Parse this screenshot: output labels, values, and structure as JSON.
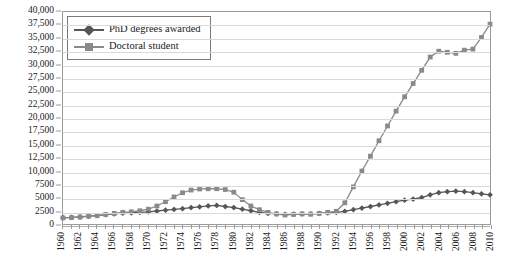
{
  "chart_data": {
    "type": "line",
    "title": "",
    "xlabel": "",
    "ylabel": "",
    "ylim": [
      0,
      40000
    ],
    "ytick_step": 2500,
    "ytick_labels": [
      "40,000",
      "37,500",
      "35,000",
      "32,500",
      "30,000",
      "27,500",
      "25,000",
      "22,500",
      "20,000",
      "17,500",
      "15,000",
      "12,500",
      "10,000",
      "7500",
      "5000",
      "2500",
      "0"
    ],
    "ytick_values": [
      40000,
      37500,
      35000,
      32500,
      30000,
      27500,
      25000,
      22500,
      20000,
      17500,
      15000,
      12500,
      10000,
      7500,
      5000,
      2500,
      0
    ],
    "xlim": [
      1960,
      2010
    ],
    "xtick_labels": [
      "1960",
      "1962",
      "1964",
      "1966",
      "1968",
      "1970",
      "1972",
      "1974",
      "1976",
      "1978",
      "1980",
      "1982",
      "1984",
      "1986",
      "1988",
      "1990",
      "1992",
      "1994",
      "1996",
      "1998",
      "2000",
      "2002",
      "2004",
      "2006",
      "2008",
      "2010"
    ],
    "xtick_label_rotation": 90,
    "x": [
      1960,
      1961,
      1962,
      1963,
      1964,
      1965,
      1966,
      1967,
      1968,
      1969,
      1970,
      1971,
      1972,
      1973,
      1974,
      1975,
      1976,
      1977,
      1978,
      1979,
      1980,
      1981,
      1982,
      1983,
      1984,
      1985,
      1986,
      1987,
      1988,
      1989,
      1990,
      1991,
      1992,
      1993,
      1994,
      1995,
      1996,
      1997,
      1998,
      1999,
      2000,
      2001,
      2002,
      2003,
      2004,
      2005,
      2006,
      2007,
      2008,
      2009,
      2010
    ],
    "grid": true,
    "legend_position": "top-left-inside",
    "series": [
      {
        "name": "PhD degrees awarded",
        "marker": "diamond",
        "color": "#565656",
        "values": [
          1200,
          1250,
          1350,
          1500,
          1600,
          1750,
          1900,
          2050,
          2100,
          2200,
          2300,
          2450,
          2600,
          2750,
          2900,
          3100,
          3250,
          3400,
          3500,
          3300,
          3100,
          2800,
          2500,
          2200,
          2000,
          1900,
          1800,
          1850,
          1900,
          1900,
          2000,
          2100,
          2200,
          2400,
          2700,
          3000,
          3300,
          3600,
          3900,
          4200,
          4500,
          4700,
          5000,
          5500,
          5900,
          6100,
          6200,
          6100,
          5900,
          5700,
          5500
        ]
      },
      {
        "name": "Doctoral student",
        "marker": "square",
        "color": "#8a8a8a",
        "values": [
          1150,
          1200,
          1300,
          1450,
          1600,
          1800,
          2000,
          2200,
          2300,
          2500,
          2800,
          3400,
          4200,
          5100,
          5900,
          6400,
          6600,
          6650,
          6650,
          6500,
          6000,
          4600,
          3400,
          2700,
          2200,
          1900,
          1700,
          1800,
          1900,
          1850,
          2000,
          2200,
          2400,
          4000,
          7000,
          10000,
          12800,
          15700,
          18500,
          21300,
          24000,
          26500,
          29000,
          31500,
          32600,
          32400,
          32200,
          32800,
          33000,
          35200,
          37700
        ]
      }
    ]
  },
  "legend": {
    "items": [
      {
        "label": "PhD degrees awarded"
      },
      {
        "label": "Doctoral student"
      }
    ]
  }
}
